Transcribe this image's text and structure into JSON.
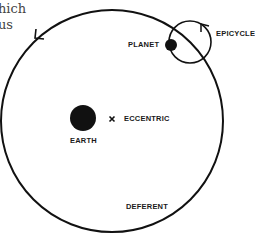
{
  "page_fragments": {
    "line1": "hich",
    "line2": "us"
  },
  "diagram": {
    "labels": {
      "planet": "PLANET",
      "epicycle": "EPICYCLE",
      "eccentric": "ECCENTRIC",
      "earth": "EARTH",
      "deferent": "DEFERENT"
    },
    "eccentric_marker": "×",
    "colors": {
      "stroke": "#111111",
      "background": "#ffffff"
    }
  }
}
